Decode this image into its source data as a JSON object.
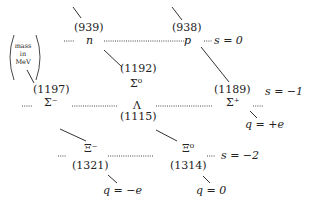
{
  "legend": {
    "line1": "mass",
    "line2": "in",
    "line3": "MeV"
  },
  "particles": {
    "n": {
      "mass": "(939)",
      "symbol": "n"
    },
    "p": {
      "mass": "(938)",
      "symbol": "p"
    },
    "sigma0": {
      "mass": "(1192)",
      "symbol": "Σ⁰"
    },
    "lambda": {
      "mass": "(1115)",
      "symbol": "Λ"
    },
    "sigma_minus": {
      "mass": "(1197)",
      "symbol": "Σ⁻"
    },
    "sigma_plus": {
      "mass": "(1189)",
      "symbol": "Σ⁺"
    },
    "xi_minus": {
      "mass": "(1321)",
      "symbol": "Ξ⁻"
    },
    "xi0": {
      "mass": "(1314)",
      "symbol": "Ξ⁰"
    }
  },
  "strangeness": {
    "s0": "s = 0",
    "s1": "s = −1",
    "s2": "s = −2"
  },
  "charge": {
    "plus": "q = +e",
    "minus": "q = −e",
    "zero": "q = 0"
  }
}
